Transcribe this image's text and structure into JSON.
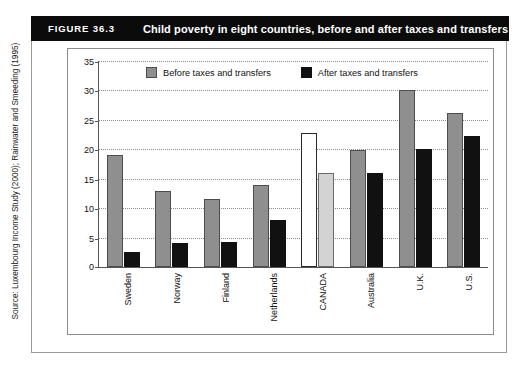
{
  "figure": {
    "number_label": "FIGURE 36.3",
    "title": "Child poverty in eight countries, before and after taxes and transfers",
    "source_note": "Source: Luxembourg Income Study (2000); Rainwater and Smeeding (1995)"
  },
  "legend": {
    "before_label": "Before taxes and transfers",
    "after_label": "After taxes and transfers"
  },
  "colors": {
    "banner_background": "#0b0b0b",
    "banner_text": "#ffffff",
    "before_bar": "#8f8f8f",
    "after_bar": "#111111",
    "highlight_before_bar": "#ffffff",
    "highlight_after_bar": "#d3d3d3",
    "gridline": "#8e8e8e",
    "axis": "#555555"
  },
  "chart_data": {
    "type": "bar",
    "title": "Child poverty in eight countries, before and after taxes and transfers",
    "xlabel": "",
    "ylabel": "",
    "ylim": [
      0,
      35
    ],
    "yticks": [
      0,
      5,
      10,
      15,
      20,
      25,
      30,
      35
    ],
    "ytick_labels": [
      "0",
      "5",
      "10",
      "15",
      "20",
      "25",
      "30",
      "35"
    ],
    "grid": true,
    "legend_position": "top-center",
    "categories": [
      "Sweden",
      "Norway",
      "Finland",
      "Netherlands",
      "CANADA",
      "Australia",
      "U.K.",
      "U.S."
    ],
    "highlight_category": "CANADA",
    "series": [
      {
        "name": "Before taxes and transfers",
        "values": [
          19.0,
          13.0,
          11.5,
          14.0,
          22.8,
          19.8,
          30.0,
          26.2
        ]
      },
      {
        "name": "After taxes and transfers",
        "values": [
          2.6,
          4.0,
          4.3,
          8.0,
          16.0,
          16.0,
          20.0,
          22.3
        ]
      }
    ]
  }
}
